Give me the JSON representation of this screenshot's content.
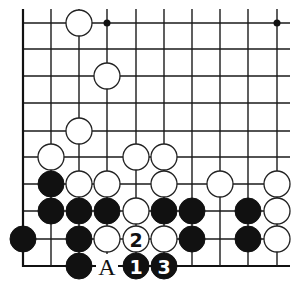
{
  "diagram": {
    "type": "go-board-fragment",
    "width": 293,
    "height": 286,
    "columns_x": [
      23,
      51,
      79,
      107,
      136,
      164,
      192,
      220,
      248,
      277
    ],
    "rows_y": [
      23,
      49,
      76,
      103,
      131,
      157,
      184,
      211,
      239,
      266
    ],
    "line_extent": {
      "top_y": 9,
      "right_x": 290
    },
    "edges": {
      "left": true,
      "bottom": true,
      "top": false,
      "right": false
    },
    "stone_radius": 13,
    "hoshi": [
      {
        "col": 3,
        "row": 0
      },
      {
        "col": 9,
        "row": 0
      }
    ],
    "stones": [
      {
        "color": "white",
        "col": 2,
        "row": 0
      },
      {
        "color": "white",
        "col": 3,
        "row": 2
      },
      {
        "color": "white",
        "col": 2,
        "row": 4
      },
      {
        "color": "white",
        "col": 1,
        "row": 5
      },
      {
        "color": "white",
        "col": 4,
        "row": 5
      },
      {
        "color": "white",
        "col": 5,
        "row": 5
      },
      {
        "color": "black",
        "col": 1,
        "row": 6
      },
      {
        "color": "white",
        "col": 2,
        "row": 6
      },
      {
        "color": "white",
        "col": 3,
        "row": 6
      },
      {
        "color": "white",
        "col": 5,
        "row": 6
      },
      {
        "color": "white",
        "col": 7,
        "row": 6
      },
      {
        "color": "white",
        "col": 9,
        "row": 6
      },
      {
        "color": "black",
        "col": 1,
        "row": 7
      },
      {
        "color": "black",
        "col": 2,
        "row": 7
      },
      {
        "color": "black",
        "col": 3,
        "row": 7
      },
      {
        "color": "white",
        "col": 4,
        "row": 7
      },
      {
        "color": "black",
        "col": 5,
        "row": 7
      },
      {
        "color": "black",
        "col": 6,
        "row": 7
      },
      {
        "color": "black",
        "col": 8,
        "row": 7
      },
      {
        "color": "white",
        "col": 9,
        "row": 7
      },
      {
        "color": "black",
        "col": 0,
        "row": 8
      },
      {
        "color": "black",
        "col": 2,
        "row": 8
      },
      {
        "color": "white",
        "col": 3,
        "row": 8
      },
      {
        "color": "white",
        "col": 4,
        "row": 8,
        "label": "2"
      },
      {
        "color": "white",
        "col": 5,
        "row": 8
      },
      {
        "color": "black",
        "col": 6,
        "row": 8
      },
      {
        "color": "black",
        "col": 8,
        "row": 8
      },
      {
        "color": "white",
        "col": 9,
        "row": 8
      },
      {
        "color": "black",
        "col": 2,
        "row": 9
      },
      {
        "color": "black",
        "col": 4,
        "row": 9,
        "label": "1"
      },
      {
        "color": "black",
        "col": 5,
        "row": 9,
        "label": "3"
      }
    ],
    "point_labels": [
      {
        "text": "A",
        "col": 3,
        "row": 9
      }
    ],
    "colors": {
      "line": "#1a1a1a",
      "black_stone": "#111111",
      "white_stone": "#ffffff",
      "background": "#ffffff"
    }
  }
}
